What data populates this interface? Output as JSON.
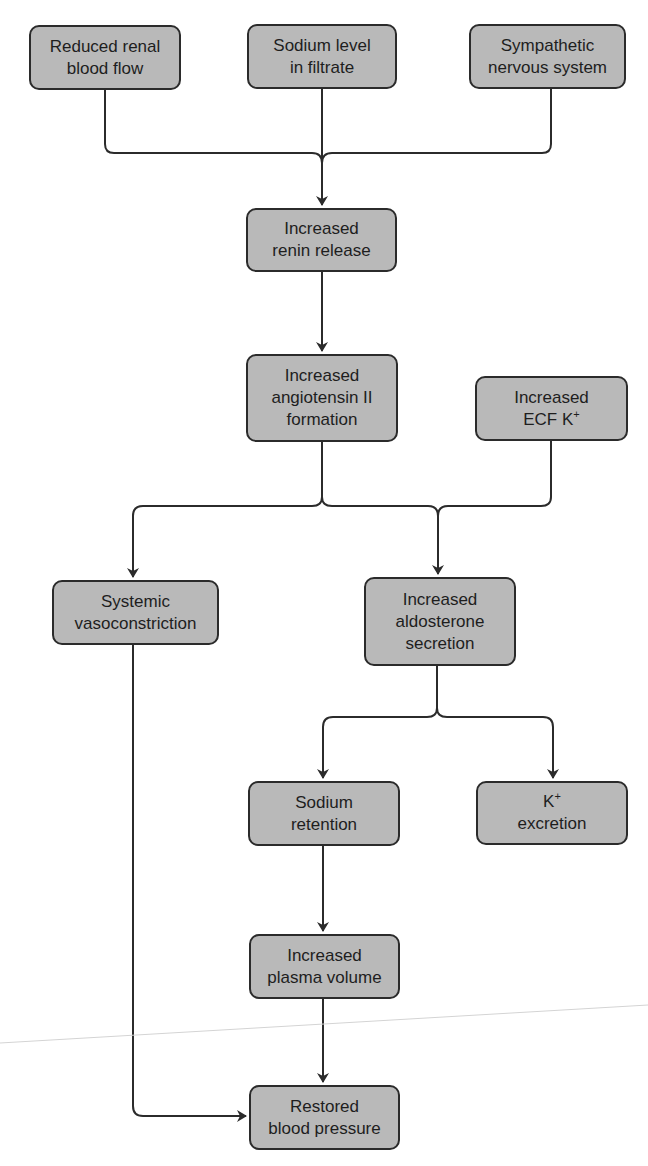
{
  "colors": {
    "node_fill": "#b9b9b9",
    "node_border": "#2b2b2b",
    "line": "#2b2b2b",
    "text": "#1e1e1e"
  },
  "nodes": {
    "reduced_renal": {
      "line1": "Reduced renal",
      "line2": "blood flow"
    },
    "sodium_level": {
      "line1": "Sodium level",
      "line2": "in filtrate"
    },
    "sympathetic": {
      "line1": "Sympathetic",
      "line2": "nervous system"
    },
    "renin": {
      "line1": "Increased",
      "line2": "renin release"
    },
    "angiotensin": {
      "line1": "Increased",
      "line2": "angiotensin II",
      "line3": "formation"
    },
    "ecf_k": {
      "line1": "Increased",
      "line2": "ECF K",
      "sup": "+"
    },
    "vasoconstriction": {
      "line1": "Systemic",
      "line2": "vasoconstriction"
    },
    "aldosterone": {
      "line1": "Increased",
      "line2": "aldosterone",
      "line3": "secretion"
    },
    "sodium_retention": {
      "line1": "Sodium",
      "line2": "retention"
    },
    "k_excretion": {
      "line1": "K",
      "sup": "+",
      "line2": "excretion"
    },
    "plasma_volume": {
      "line1": "Increased",
      "line2": "plasma volume"
    },
    "restored_bp": {
      "line1": "Restored",
      "line2": "blood pressure"
    }
  },
  "edges": [
    [
      "reduced_renal",
      "renin"
    ],
    [
      "sodium_level",
      "renin"
    ],
    [
      "sympathetic",
      "renin"
    ],
    [
      "renin",
      "angiotensin"
    ],
    [
      "angiotensin",
      "vasoconstriction"
    ],
    [
      "angiotensin",
      "aldosterone"
    ],
    [
      "ecf_k",
      "aldosterone"
    ],
    [
      "aldosterone",
      "sodium_retention"
    ],
    [
      "aldosterone",
      "k_excretion"
    ],
    [
      "sodium_retention",
      "plasma_volume"
    ],
    [
      "plasma_volume",
      "restored_bp"
    ],
    [
      "vasoconstriction",
      "restored_bp"
    ]
  ]
}
